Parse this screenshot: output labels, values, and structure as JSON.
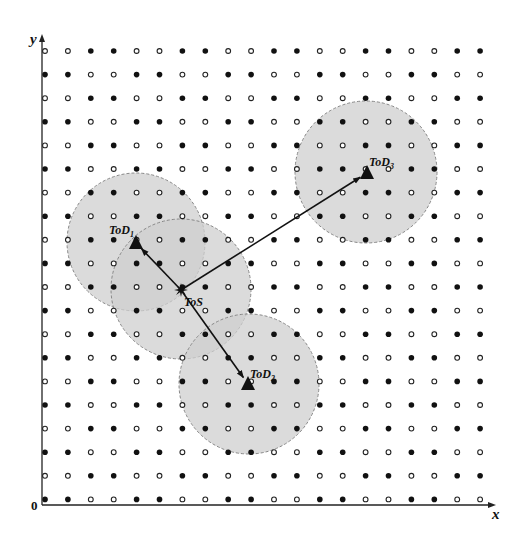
{
  "diagram": {
    "axes": {
      "x_label": "x",
      "y_label": "y",
      "origin_label": "0",
      "origin": [
        42,
        505
      ],
      "x_end": 496,
      "y_end": 34
    },
    "grid": {
      "columns": 20,
      "rows": 20,
      "x0": 45,
      "y0": 51,
      "dx": 22.9,
      "dy": 23.6,
      "pattern": "2x2 block checkerboard; even rows (from top) start with two hollow dots then two filled dots; odd rows start with two filled then two hollow",
      "filled_color": "#111111",
      "hollow_stroke": "#222222"
    },
    "coverage_circles": [
      {
        "id": "tod1",
        "cx": 136,
        "cy": 242,
        "r": 69
      },
      {
        "id": "tos",
        "cx": 181,
        "cy": 289,
        "r": 70
      },
      {
        "id": "tod2",
        "cx": 249,
        "cy": 384,
        "r": 70
      },
      {
        "id": "tod3",
        "cx": 366,
        "cy": 172,
        "r": 71
      }
    ],
    "circle_fill": "#cfcfcf",
    "circle_stroke": "#888888",
    "nodes": [
      {
        "id": "tos",
        "label": "ToS",
        "sub": "",
        "shape": "star",
        "x": 181,
        "y": 290,
        "label_x": 184,
        "label_y": 306
      },
      {
        "id": "tod1",
        "label": "ToD",
        "sub": "1",
        "shape": "triangle",
        "x": 136,
        "y": 243,
        "label_x": 109,
        "label_y": 234
      },
      {
        "id": "tod2",
        "label": "ToD",
        "sub": "2",
        "shape": "triangle",
        "x": 248,
        "y": 384,
        "label_x": 250,
        "label_y": 378
      },
      {
        "id": "tod3",
        "label": "ToD",
        "sub": "3",
        "shape": "triangle",
        "x": 367,
        "y": 173,
        "label_x": 369,
        "label_y": 166
      }
    ],
    "arrows": [
      {
        "from": "tos",
        "to": "tod1"
      },
      {
        "from": "tos",
        "to": "tod2"
      },
      {
        "from": "tos",
        "to": "tod3"
      }
    ]
  }
}
